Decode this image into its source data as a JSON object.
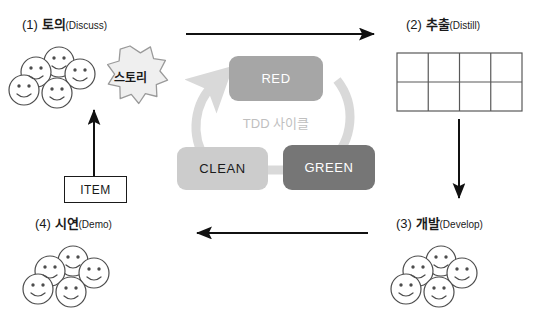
{
  "diagram": {
    "title_center": "TDD 사이클",
    "quadrants": [
      {
        "num": "(1)",
        "ko": "토의",
        "en": "(Discuss)",
        "name": "discuss"
      },
      {
        "num": "(2)",
        "ko": "추출",
        "en": "(Distill)",
        "name": "distill"
      },
      {
        "num": "(3)",
        "ko": "개발",
        "en": "(Develop)",
        "name": "develop"
      },
      {
        "num": "(4)",
        "ko": "시연",
        "en": "(Demo)",
        "name": "demo"
      }
    ],
    "story_label": "스토리",
    "item_label": "ITEM",
    "tdd_boxes": [
      {
        "label": "RED",
        "color": "#a6a6a6",
        "text_color": "#ffffff"
      },
      {
        "label": "CLEAN",
        "color": "#cccccc",
        "text_color": "#1a1a1a"
      },
      {
        "label": "GREEN",
        "color": "#767676",
        "text_color": "#ffffff"
      }
    ],
    "distill_table": {
      "rows": 2,
      "cols": 4,
      "cells": [
        [
          "",
          "",
          "",
          ""
        ],
        [
          "",
          "",
          "",
          ""
        ]
      ]
    },
    "people_groups": [
      {
        "name": "discuss-people",
        "count": 5
      },
      {
        "name": "develop-people",
        "count": 5
      },
      {
        "name": "demo-people",
        "count": 5
      }
    ],
    "arrows": [
      {
        "name": "arrow-discuss-to-distill",
        "direction": "right"
      },
      {
        "name": "arrow-distill-to-develop",
        "direction": "down"
      },
      {
        "name": "arrow-develop-to-demo",
        "direction": "left"
      },
      {
        "name": "arrow-demo-to-discuss",
        "direction": "up"
      }
    ],
    "colors": {
      "line": "#111111",
      "cycle_arc": "#d9d9d9",
      "table_border": "#595959",
      "face_stroke": "#4d4d4d",
      "story_fill": "#efefef",
      "story_stroke": "#9a9a9a"
    }
  }
}
